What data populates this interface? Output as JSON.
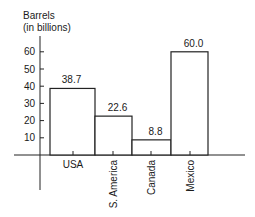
{
  "chart_data": {
    "type": "bar",
    "title": "",
    "ylabel_lines": [
      "Barrels",
      "(in billions)"
    ],
    "xlabel": "",
    "categories": [
      "USA",
      "S. America",
      "Canada",
      "Mexico"
    ],
    "values": [
      38.7,
      22.6,
      8.8,
      60.0
    ],
    "value_labels": [
      "38.7",
      "22.6",
      "8.8",
      "60.0"
    ],
    "yticks": [
      10,
      20,
      30,
      40,
      50,
      60
    ],
    "ylim": [
      0,
      65
    ],
    "grid": false,
    "legend": null,
    "bar_fill": "#ffffff",
    "bar_stroke": "#222222",
    "category_label_orientation": [
      "horizontal",
      "vertical",
      "vertical",
      "vertical"
    ]
  }
}
